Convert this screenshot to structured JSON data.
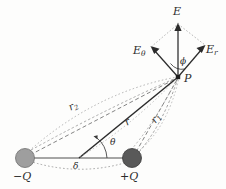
{
  "figure": {
    "type": "physics-vector-diagram",
    "background_color": "#fdfdfc",
    "stroke_color": "#2b2b2b",
    "dashed_color": "#8a8a8a",
    "charges": [
      {
        "id": "negative-charge",
        "label": "−Q",
        "cx": 25,
        "cy": 158,
        "r": 9.5,
        "fill": "#9e9e9e",
        "stroke": "#6f6f6f"
      },
      {
        "id": "positive-charge",
        "label": "+Q",
        "cx": 132,
        "cy": 158,
        "r": 9.5,
        "fill": "#595959",
        "stroke": "#3a3a3a"
      }
    ],
    "points": [
      {
        "id": "field-point",
        "label": "P",
        "x": 178,
        "y": 77
      },
      {
        "id": "dipole-center",
        "label": "",
        "x": 78.5,
        "y": 158
      }
    ],
    "vectors": [
      {
        "id": "resultant-field",
        "label": "E",
        "from": [
          178,
          77
        ],
        "to": [
          178,
          26
        ]
      },
      {
        "id": "theta-component",
        "label": "Eθ",
        "base": "E",
        "sub": "θ",
        "from": [
          178,
          77
        ],
        "to": [
          152,
          48
        ]
      },
      {
        "id": "radial-component",
        "label": "Er",
        "base": "E",
        "sub": "r",
        "from": [
          178,
          77
        ],
        "to": [
          204,
          46
        ]
      }
    ],
    "distances": [
      {
        "id": "r-to-point",
        "label": "r",
        "sub": "",
        "from": [
          78.5,
          158
        ],
        "to": [
          178,
          77
        ],
        "style": "solid"
      },
      {
        "id": "r1-from-positive",
        "label": "r",
        "sub": "1",
        "from": [
          132,
          158
        ],
        "to": [
          178,
          77
        ],
        "style": "dashed"
      },
      {
        "id": "r2-from-negative",
        "label": "r",
        "sub": "2",
        "from": [
          25,
          158
        ],
        "to": [
          178,
          77
        ],
        "style": "dashed"
      },
      {
        "id": "separation",
        "label": "δ",
        "sub": "",
        "from": [
          25,
          158
        ],
        "to": [
          132,
          158
        ],
        "style": "arc-dotted"
      }
    ],
    "angles": [
      {
        "id": "theta-angle",
        "label": "θ",
        "vertex": [
          78.5,
          158
        ],
        "x": 110,
        "y": 140
      },
      {
        "id": "phi-angle",
        "label": "ϕ",
        "vertex": [
          178,
          77
        ],
        "x": 172,
        "y": 58
      }
    ],
    "labels": {
      "E": "E",
      "E_theta_base": "E",
      "E_theta_sub": "θ",
      "E_r_base": "E",
      "E_r_sub": "r",
      "P": "P",
      "phi": "ϕ",
      "theta": "θ",
      "delta": "δ",
      "r": "r",
      "r1_base": "r",
      "r1_sub": "1",
      "r2_base": "r",
      "r2_sub": "2",
      "neg_charge": "−Q",
      "pos_charge": "+Q"
    }
  }
}
